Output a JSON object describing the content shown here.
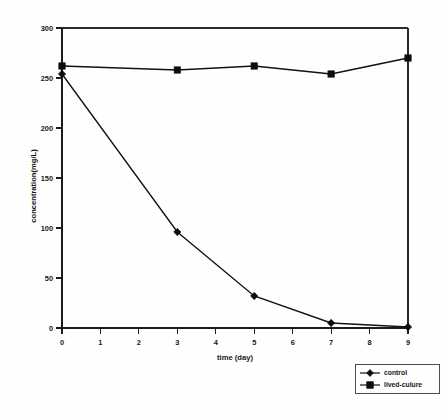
{
  "chart_data": {
    "type": "line",
    "title": "",
    "xlabel": "time (day)",
    "ylabel": "concentration(mg/L)",
    "x": [
      0,
      3,
      5,
      7,
      9
    ],
    "xlim": [
      0,
      9
    ],
    "ylim": [
      0,
      300
    ],
    "xticks": [
      "0",
      "1",
      "2",
      "3",
      "4",
      "5",
      "6",
      "7",
      "8",
      "9"
    ],
    "yticks": [
      "0",
      "50",
      "100",
      "150",
      "200",
      "250",
      "300"
    ],
    "grid": false,
    "legend_position": "outside bottom-right",
    "series": [
      {
        "name": "control",
        "marker": "diamond",
        "values": [
          254,
          96,
          32,
          5,
          1
        ]
      },
      {
        "name": "lived-culure",
        "marker": "square",
        "values": [
          262,
          258,
          262,
          254,
          270
        ]
      }
    ]
  },
  "legend": {
    "entries": [
      {
        "label": "control",
        "marker": "diamond-marker-icon"
      },
      {
        "label": "lived-culure",
        "marker": "square-marker-icon"
      }
    ]
  },
  "colors": {
    "ink": "#111111",
    "background": "#ffffff",
    "frame": "#2a2a2a"
  }
}
